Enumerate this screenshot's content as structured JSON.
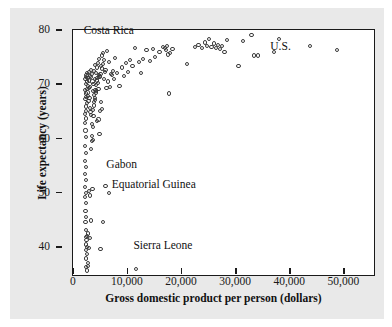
{
  "figure": {
    "background_color": "#e9e9e9",
    "plot_background_color": "#ffffff",
    "frame_color": "#1a1a1a",
    "marker_color": "#3b3b3b"
  },
  "chart_data": {
    "type": "scatter",
    "title": "",
    "xlabel": "Gross domestic product per person (dollars)",
    "ylabel": "Life expectancy (years)",
    "xlim": [
      -2000,
      54000
    ],
    "ylim": [
      36.0,
      81.5
    ],
    "xticks": [
      0,
      10000,
      20000,
      30000,
      40000,
      50000
    ],
    "xticklabels": [
      "0",
      "10,000",
      "20,000",
      "30,000",
      "40,000",
      "50,000"
    ],
    "yticks": [
      40,
      50,
      60,
      70,
      80
    ],
    "yticklabels": [
      "40",
      "50",
      "60",
      "70",
      "80"
    ],
    "grid": false,
    "legend": null,
    "marker": "open-circle",
    "annotations": [
      {
        "label": "Costa Rica",
        "x": 2000,
        "y": 79.6,
        "point_x": 9500,
        "point_y": 78.2
      },
      {
        "label": "U.S.",
        "x": 36500,
        "y": 76.8,
        "point_x": 35200,
        "point_y": 77.4
      },
      {
        "label": "Gabon",
        "x": 6200,
        "y": 55.0,
        "point_x": 4000,
        "point_y": 52.8
      },
      {
        "label": "Equatorial Guinea",
        "x": 7200,
        "y": 51.3,
        "point_x": 4700,
        "point_y": 51.4
      },
      {
        "label": "Sierra Leone",
        "x": 11200,
        "y": 40.0,
        "point_x": 9600,
        "point_y": 37.5
      }
    ],
    "points": [
      [
        300,
        72.4
      ],
      [
        400,
        72.9
      ],
      [
        350,
        71.6
      ],
      [
        500,
        73.2
      ],
      [
        250,
        70.4
      ],
      [
        450,
        69.8
      ],
      [
        600,
        72.0
      ],
      [
        320,
        68.8
      ],
      [
        700,
        71.2
      ],
      [
        380,
        67.4
      ],
      [
        280,
        66.0
      ],
      [
        520,
        70.6
      ],
      [
        640,
        73.6
      ],
      [
        430,
        69.2
      ],
      [
        360,
        65.2
      ],
      [
        240,
        64.4
      ],
      [
        800,
        72.6
      ],
      [
        560,
        68.0
      ],
      [
        310,
        63.0
      ],
      [
        470,
        66.6
      ],
      [
        900,
        73.8
      ],
      [
        680,
        70.0
      ],
      [
        340,
        61.8
      ],
      [
        260,
        60.2
      ],
      [
        1000,
        72.2
      ],
      [
        750,
        69.4
      ],
      [
        420,
        58.8
      ],
      [
        290,
        57.4
      ],
      [
        1100,
        71.0
      ],
      [
        870,
        68.4
      ],
      [
        330,
        56.2
      ],
      [
        230,
        55.0
      ],
      [
        1200,
        73.0
      ],
      [
        950,
        70.8
      ],
      [
        410,
        53.8
      ],
      [
        270,
        52.6
      ],
      [
        1300,
        72.8
      ],
      [
        1050,
        69.0
      ],
      [
        360,
        51.4
      ],
      [
        250,
        50.8
      ],
      [
        1400,
        74.2
      ],
      [
        1150,
        67.2
      ],
      [
        390,
        49.6
      ],
      [
        300,
        48.2
      ],
      [
        1500,
        73.4
      ],
      [
        1250,
        66.4
      ],
      [
        440,
        47.0
      ],
      [
        320,
        46.2
      ],
      [
        1600,
        72.0
      ],
      [
        1350,
        65.8
      ],
      [
        470,
        44.6
      ],
      [
        350,
        43.4
      ],
      [
        1700,
        70.2
      ],
      [
        1450,
        64.2
      ],
      [
        500,
        42.8
      ],
      [
        380,
        42.0
      ],
      [
        1800,
        71.6
      ],
      [
        1550,
        62.0
      ],
      [
        560,
        41.6
      ],
      [
        400,
        41.0
      ],
      [
        1900,
        74.0
      ],
      [
        1650,
        61.2
      ],
      [
        600,
        40.2
      ],
      [
        420,
        39.4
      ],
      [
        2000,
        72.5
      ],
      [
        1750,
        66.8
      ],
      [
        700,
        38.6
      ],
      [
        460,
        37.8
      ],
      [
        2100,
        75.0
      ],
      [
        1850,
        69.6
      ],
      [
        820,
        38.0
      ],
      [
        520,
        37.2
      ],
      [
        2200,
        73.6
      ],
      [
        1950,
        68.2
      ],
      [
        1000,
        41.4
      ],
      [
        600,
        43.6
      ],
      [
        2400,
        74.6
      ],
      [
        2150,
        70.4
      ],
      [
        1200,
        43.2
      ],
      [
        700,
        44.0
      ],
      [
        2600,
        75.4
      ],
      [
        2300,
        71.4
      ],
      [
        1400,
        46.4
      ],
      [
        900,
        51.8
      ],
      [
        2800,
        76.2
      ],
      [
        2500,
        72.2
      ],
      [
        1600,
        52.2
      ],
      [
        1100,
        51.0
      ],
      [
        3000,
        73.0
      ],
      [
        2700,
        70.6
      ],
      [
        1800,
        65.6
      ],
      [
        1300,
        59.6
      ],
      [
        3200,
        74.8
      ],
      [
        2900,
        72.8
      ],
      [
        2000,
        68.6
      ],
      [
        1500,
        61.0
      ],
      [
        3400,
        76.8
      ],
      [
        3100,
        73.4
      ],
      [
        2200,
        70.0
      ],
      [
        1700,
        63.6
      ],
      [
        3600,
        77.2
      ],
      [
        3300,
        74.4
      ],
      [
        2400,
        72.6
      ],
      [
        1900,
        67.6
      ],
      [
        3800,
        76.0
      ],
      [
        3500,
        75.2
      ],
      [
        2600,
        71.8
      ],
      [
        2100,
        69.0
      ],
      [
        4000,
        74.2
      ],
      [
        3700,
        72.4
      ],
      [
        2800,
        73.2
      ],
      [
        2300,
        70.2
      ],
      [
        4300,
        77.6
      ],
      [
        3900,
        73.8
      ],
      [
        3000,
        66.6
      ],
      [
        2500,
        64.8
      ],
      [
        4600,
        75.6
      ],
      [
        4200,
        70.8
      ],
      [
        3200,
        68.2
      ],
      [
        2700,
        65.0
      ],
      [
        5000,
        73.4
      ],
      [
        4400,
        72.0
      ],
      [
        3400,
        67.0
      ],
      [
        2900,
        62.4
      ],
      [
        5400,
        74.0
      ],
      [
        4800,
        71.0
      ],
      [
        3600,
        46.2
      ],
      [
        3100,
        41.2
      ],
      [
        5800,
        76.4
      ],
      [
        5200,
        73.2
      ],
      [
        4000,
        52.8
      ],
      [
        4700,
        51.4
      ],
      [
        6200,
        73.6
      ],
      [
        5600,
        72.4
      ],
      [
        6600,
        71.2
      ],
      [
        7000,
        74.6
      ],
      [
        7400,
        73.0
      ],
      [
        7800,
        75.4
      ],
      [
        8200,
        73.8
      ],
      [
        8600,
        76.0
      ],
      [
        9000,
        74.8
      ],
      [
        9600,
        37.5
      ],
      [
        9500,
        78.2
      ],
      [
        10200,
        75.6
      ],
      [
        10600,
        73.6
      ],
      [
        11000,
        76.2
      ],
      [
        11600,
        77.8
      ],
      [
        12200,
        75.8
      ],
      [
        12800,
        78.0
      ],
      [
        13200,
        76.6
      ],
      [
        14000,
        77.4
      ],
      [
        14600,
        78.4
      ],
      [
        15000,
        78.2
      ],
      [
        15200,
        77.8
      ],
      [
        15400,
        78.6
      ],
      [
        15600,
        77.0
      ],
      [
        15800,
        69.8
      ],
      [
        16000,
        77.2
      ],
      [
        16400,
        78.0
      ],
      [
        19000,
        75.2
      ],
      [
        20600,
        78.4
      ],
      [
        21200,
        78.8
      ],
      [
        21800,
        78.2
      ],
      [
        22400,
        79.2
      ],
      [
        22800,
        78.6
      ],
      [
        23200,
        79.8
      ],
      [
        23600,
        78.4
      ],
      [
        24000,
        79.0
      ],
      [
        24400,
        78.2
      ],
      [
        24800,
        78.8
      ],
      [
        25200,
        78.0
      ],
      [
        25600,
        78.6
      ],
      [
        26000,
        77.4
      ],
      [
        26400,
        79.6
      ],
      [
        28600,
        74.8
      ],
      [
        29400,
        79.4
      ],
      [
        31000,
        80.6
      ],
      [
        31400,
        76.8
      ],
      [
        32200,
        76.8
      ],
      [
        35200,
        77.4
      ],
      [
        36000,
        79.8
      ],
      [
        41800,
        78.6
      ],
      [
        46800,
        77.8
      ]
    ]
  }
}
